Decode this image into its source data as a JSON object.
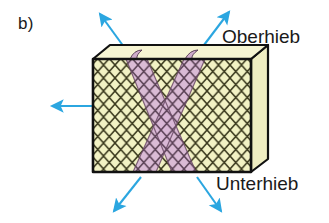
{
  "figure": {
    "panel_label": "b)",
    "labels": {
      "top_cut": "Oberhieb",
      "bottom_cut": "Unterhieb"
    },
    "colors": {
      "block_face": "#f2f2c4",
      "block_top": "#f5f3cf",
      "block_side": "#f0eec6",
      "hatch_line": "#3b3a1e",
      "band_fill": "#d9b8d6",
      "band_line": "#6b4a66",
      "outline": "#111111",
      "arrow": "#2ba6e0",
      "text": "#1a1a1a",
      "background": "#ffffff"
    },
    "block": {
      "shape": "isometric-rectangular-slab",
      "front_face_pattern": "diamond-cross-hatch",
      "crossing_bands": 2,
      "band_arrangement": "X-cross"
    },
    "arrows": [
      {
        "name": "arrow-top-left",
        "direction": "up-left",
        "from": [
          122,
          46
        ],
        "to": [
          98,
          12
        ]
      },
      {
        "name": "arrow-top-right",
        "direction": "up-right",
        "from": [
          200,
          48
        ],
        "to": [
          228,
          10
        ]
      },
      {
        "name": "arrow-left",
        "direction": "left",
        "from": [
          92,
          106
        ],
        "to": [
          50,
          106
        ]
      },
      {
        "name": "arrow-bottom-left",
        "direction": "down-left",
        "from": [
          140,
          176
        ],
        "to": [
          112,
          213
        ]
      },
      {
        "name": "arrow-bottom-right",
        "direction": "down-right",
        "from": [
          196,
          176
        ],
        "to": [
          222,
          213
        ]
      }
    ]
  }
}
